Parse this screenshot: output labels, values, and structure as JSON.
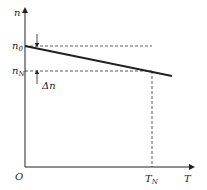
{
  "diagram": {
    "title": "",
    "axes": {
      "y_label": "n",
      "x_label": "T",
      "origin_label": "O"
    },
    "labels": {
      "n0": {
        "base": "n",
        "sub": "0"
      },
      "nN": {
        "base": "n",
        "sub": "N"
      },
      "delta_n": "Δn",
      "TN": {
        "base": "T",
        "sub": "N"
      }
    },
    "colors": {
      "line": "#222222",
      "dashed": "#333333"
    }
  }
}
